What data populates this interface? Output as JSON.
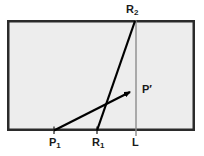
{
  "diagram": {
    "canvas": {
      "width": 204,
      "height": 156,
      "background": "#ffffff"
    },
    "region": {
      "name": "shaded-rectangle",
      "x": 7,
      "y": 20,
      "width": 188,
      "height": 111,
      "fill": "#ededed",
      "stroke": "#2b2b2b",
      "stroke_width": 2.5
    },
    "labels": {
      "r2": {
        "text": "R",
        "sub": "2"
      },
      "r1": {
        "text": "R",
        "sub": "1"
      },
      "p1": {
        "text": "P",
        "sub": "1"
      },
      "l": {
        "text": "L"
      },
      "p_prime": {
        "text": "P",
        "prime": "′"
      }
    },
    "lines": [
      {
        "name": "line-R1-R2",
        "from": {
          "x": 97,
          "y": 130
        },
        "to": {
          "x": 135,
          "y": 21
        },
        "color": "#000000",
        "width": 2.2,
        "arrow": false
      },
      {
        "name": "line-P1-Pprime",
        "from": {
          "x": 54,
          "y": 130
        },
        "to": {
          "x": 134,
          "y": 90
        },
        "color": "#000000",
        "width": 2.2,
        "arrow": true
      },
      {
        "name": "vertical-line-L",
        "from": {
          "x": 136,
          "y": 20
        },
        "to": {
          "x": 136,
          "y": 136
        },
        "color": "#8c8c8c",
        "width": 1.4,
        "arrow": false
      }
    ],
    "ticks": [
      {
        "name": "tick-P1",
        "x": 54,
        "y_top": 126,
        "y_bottom": 134
      },
      {
        "name": "tick-R1",
        "x": 97,
        "y_top": 126,
        "y_bottom": 134
      },
      {
        "name": "tick-L",
        "x": 136,
        "y_top": 126,
        "y_bottom": 136
      }
    ],
    "colors": {
      "region_fill": "#ededed",
      "region_stroke": "#2b2b2b",
      "ray_color": "#000000",
      "guide_color": "#8c8c8c",
      "text_color": "#1a1a1a",
      "page_background": "#ffffff"
    }
  }
}
